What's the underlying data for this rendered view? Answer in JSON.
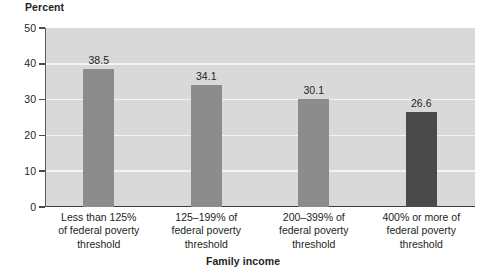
{
  "chart_data": {
    "type": "bar",
    "title": "",
    "categories": [
      "Less than 125% of federal poverty threshold",
      "125–199% of federal poverty threshold",
      "200–399% of federal poverty threshold",
      "400% or more of federal poverty threshold"
    ],
    "category_lines": [
      [
        "Less than 125%",
        "of federal poverty",
        "threshold"
      ],
      [
        "125–199% of",
        "federal poverty",
        "threshold"
      ],
      [
        "200–399% of",
        "federal poverty",
        "threshold"
      ],
      [
        "400% or more of",
        "federal poverty",
        "threshold"
      ]
    ],
    "values": [
      38.5,
      34.1,
      30.1,
      26.6
    ],
    "value_labels": [
      "38.5",
      "34.1",
      "30.1",
      "26.6"
    ],
    "xlabel": "Family income",
    "ylabel": "Percent",
    "ylim": [
      0,
      50
    ],
    "yticks": [
      0,
      10,
      20,
      30,
      40,
      50
    ],
    "ytick_labels": [
      "0",
      "10",
      "20",
      "30",
      "40",
      "50"
    ],
    "grid": "horizontal",
    "legend": "none",
    "bar_colors": [
      "#8c8c8c",
      "#8c8c8c",
      "#8c8c8c",
      "#4a4a4a"
    ],
    "plot_background": "#d9d9d9",
    "gridline_color": "#f4f4f4",
    "axis_color": "#3d3d3d"
  },
  "axes": {
    "y_title": "Percent",
    "x_title": "Family income"
  }
}
